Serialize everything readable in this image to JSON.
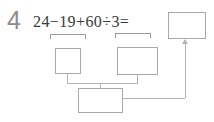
{
  "problem": {
    "number": "4",
    "expression": "24−19+60÷3=",
    "terms": [
      "24",
      "−",
      "19",
      "+",
      "60",
      "÷",
      "3",
      "="
    ],
    "sub_expressions": [
      "24−19",
      "60÷3"
    ]
  },
  "boxes": {
    "answer": {
      "value": "",
      "label": "answer-box"
    },
    "step_1": {
      "value": "",
      "label": "first-operation-result"
    },
    "step_2": {
      "value": "",
      "label": "second-operation-result"
    },
    "step_3": {
      "value": "",
      "label": "combined-result"
    }
  },
  "colors": {
    "number": "#8c8c8c",
    "expression": "#3a3a3a",
    "box_border": "#a9a9a9",
    "connector": "#b4b4b4",
    "bracket": "#9b9b9b",
    "background": "#ffffff"
  }
}
